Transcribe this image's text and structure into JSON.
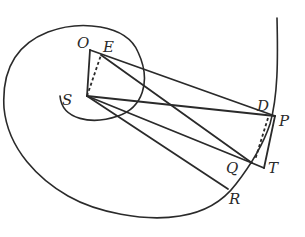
{
  "diagram": {
    "type": "geometric-figure",
    "labels": {
      "O": "O",
      "E": "E",
      "S": "S",
      "D": "D",
      "P": "P",
      "Q": "Q",
      "T": "T",
      "R": "R"
    },
    "points": {
      "O": [
        90,
        50
      ],
      "E": [
        101,
        55
      ],
      "S": [
        87,
        96
      ],
      "D": [
        268,
        118
      ],
      "P": [
        275,
        116
      ],
      "Q": [
        252,
        163
      ],
      "T": [
        264,
        168
      ],
      "R": [
        228,
        189
      ]
    },
    "segments": [
      [
        "O",
        "S"
      ],
      [
        "O",
        "P"
      ],
      [
        "E",
        "Q"
      ],
      [
        "S",
        "P"
      ],
      [
        "S",
        "Q"
      ],
      [
        "S",
        "R"
      ],
      [
        "P",
        "T"
      ],
      [
        "Q",
        "T"
      ]
    ],
    "dashed_segments": [
      [
        "S",
        "E"
      ],
      [
        "D",
        "Q"
      ]
    ],
    "stroke_color": "#2a2a2a"
  }
}
